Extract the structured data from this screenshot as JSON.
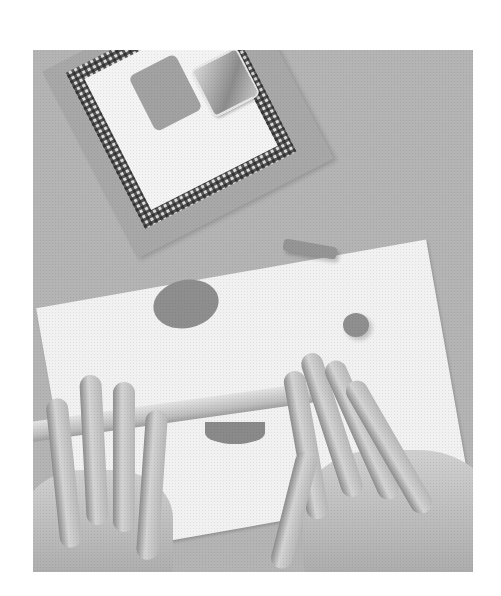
{
  "image": {
    "description": "Grayscale craft photograph: a pair of hands rolling out clay with a rolling pin on a sheet of white paper; a gingham-bordered card frame with a clay square and a glass square tile sits at the top left; a clay oval, a clay log, and a small clay ball lie on the paper.",
    "colors": {
      "page_background": "#ffffff",
      "table_surface": "#b4b4b4",
      "paper": "#f1f1f1",
      "clay": "#8e8e8e"
    },
    "objects": [
      {
        "name": "gingham-frame-card"
      },
      {
        "name": "clay-square-tile"
      },
      {
        "name": "glass-square-tile"
      },
      {
        "name": "white-paper-sheet"
      },
      {
        "name": "clay-oval"
      },
      {
        "name": "clay-log"
      },
      {
        "name": "clay-ball"
      },
      {
        "name": "rolling-pin"
      },
      {
        "name": "left-hand"
      },
      {
        "name": "right-hand"
      },
      {
        "name": "flattened-clay"
      }
    ]
  }
}
